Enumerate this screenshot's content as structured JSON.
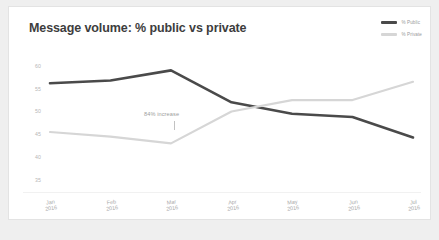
{
  "card": {
    "title": "Message volume: % public vs private",
    "background": "#ffffff",
    "border_color": "#e3e3e3",
    "page_background": "#efefef"
  },
  "legend": {
    "position": "top-right",
    "items": [
      {
        "label": "% Public",
        "color": "#4a4a4a"
      },
      {
        "label": "% Private",
        "color": "#d6d6d6"
      }
    ]
  },
  "annotation": {
    "text": "84% increase"
  },
  "chart_data": {
    "type": "line",
    "title": "Message volume: % public vs private",
    "xlabel": "",
    "ylabel": "",
    "categories": [
      "Jan\n2016",
      "Feb\n2016",
      "Mar\n2016",
      "Apr\n2016",
      "May\n2016",
      "Jun\n2016",
      "Jul\n2016"
    ],
    "x_tick_labels": [
      [
        "Jan",
        "2016"
      ],
      [
        "Feb",
        "2016"
      ],
      [
        "Mar",
        "2016"
      ],
      [
        "Apr",
        "2016"
      ],
      [
        "May",
        "2016"
      ],
      [
        "Jun",
        "2016"
      ],
      [
        "Jul",
        "2016"
      ]
    ],
    "y_tick_labels": [
      "60",
      "55",
      "50",
      "45",
      "40",
      "35"
    ],
    "y_ticks": [
      60,
      55,
      50,
      45,
      40,
      35
    ],
    "ylim": [
      33,
      61.5
    ],
    "grid": false,
    "legend_position": "top-right",
    "series": [
      {
        "name": "% Public",
        "color": "#4a4a4a",
        "width": 2.6,
        "values": [
          56.2,
          56.8,
          59.0,
          52.0,
          49.5,
          48.8,
          44.3
        ]
      },
      {
        "name": "% Private",
        "color": "#d6d6d6",
        "width": 2.2,
        "values": [
          45.5,
          44.5,
          43.0,
          50.0,
          52.5,
          52.5,
          56.5
        ]
      }
    ],
    "annotations": [
      {
        "text": "84% increase",
        "x_category": "Mar\n2016",
        "y": 49.3
      }
    ]
  }
}
